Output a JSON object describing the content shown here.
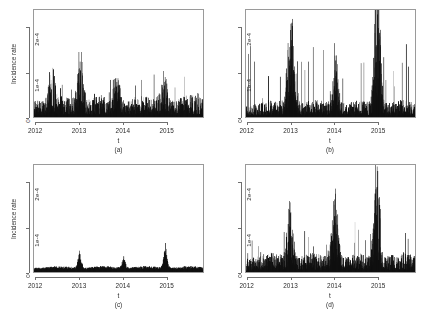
{
  "figure": {
    "width": 423,
    "height": 310,
    "background": "#ffffff",
    "ink_color": "#111111",
    "axis_color": "#6f6f6f",
    "box_color": "#9a9a9a",
    "panel_count": 4,
    "layout": "2x2 grid of time-series panels"
  },
  "chart_data": [
    {
      "id": "a",
      "type": "area",
      "caption": "(a)",
      "title": "",
      "xlabel": "t",
      "ylabel": "Incidence rate",
      "show_ylabel": true,
      "xtick_labels": [
        "2012",
        "2013",
        "2014",
        "2015"
      ],
      "xtick_values": [
        2012,
        2013,
        2014,
        2015
      ],
      "ytick_labels": [
        "0",
        "1e-4",
        "2e-4"
      ],
      "ytick_values": [
        0,
        0.0001,
        0.0002
      ],
      "xlim": [
        2011.95,
        2015.85
      ],
      "ylim": [
        0,
        0.00024
      ],
      "grid": false,
      "legend": "none",
      "series_description": "Daily incidence rate, dense noisy spikes on a raised baseline; broad seasonal humps peaking near 2013 (max ~1.05e-4), smaller humps near 2012.4, 2013.85, 2014.95.",
      "peaks": [
        {
          "x": 2012.35,
          "y": 6.2e-05
        },
        {
          "x": 2013.02,
          "y": 0.000105
        },
        {
          "x": 2013.85,
          "y": 6.8e-05
        },
        {
          "x": 2014.95,
          "y": 6.2e-05
        }
      ],
      "baseline_level": 1.8e-05,
      "noise_scale": 2e-05,
      "max_value": 0.000105,
      "seed": 17
    },
    {
      "id": "b",
      "type": "area",
      "caption": "(b)",
      "title": "",
      "xlabel": "t",
      "ylabel": "",
      "show_ylabel": false,
      "xtick_labels": [
        "2012",
        "2013",
        "2014",
        "2015"
      ],
      "xtick_values": [
        2012,
        2013,
        2014,
        2015
      ],
      "ytick_labels": [
        "0",
        "1e-4",
        "2e-4"
      ],
      "ytick_values": [
        0,
        0.0001,
        0.0002
      ],
      "xlim": [
        2011.95,
        2015.85
      ],
      "ylim": [
        0,
        0.00024
      ],
      "grid": false,
      "legend": "none",
      "series_description": "Very spiky daily series with tall thin isolated spikes; clusters near 2013 (~1.15e-4), 2014 (~1.05e-4) and a dominant single spike at 2015 reaching ~2.3e-4.",
      "peaks": [
        {
          "x": 2012.95,
          "y": 0.000115
        },
        {
          "x": 2013.05,
          "y": 0.000105
        },
        {
          "x": 2014.0,
          "y": 0.000105
        },
        {
          "x": 2014.98,
          "y": 0.00023
        }
      ],
      "baseline_level": 1.4e-05,
      "noise_scale": 4e-05,
      "max_value": 0.00023,
      "seed": 42
    },
    {
      "id": "c",
      "type": "area",
      "caption": "(c)",
      "title": "",
      "xlabel": "t",
      "ylabel": "Incidence rate",
      "show_ylabel": true,
      "xtick_labels": [
        "2012",
        "2013",
        "2014",
        "2015"
      ],
      "xtick_values": [
        2012,
        2013,
        2014,
        2015
      ],
      "ytick_labels": [
        "0",
        "1e-4",
        "2e-4"
      ],
      "ytick_values": [
        0,
        0.0001,
        0.0002
      ],
      "xlim": [
        2011.95,
        2015.85
      ],
      "ylim": [
        0,
        0.00024
      ],
      "grid": false,
      "legend": "none",
      "series_description": "Smoothed low-amplitude series close to zero with three narrow annual peaks at 2013 (~0.48e-4), 2014 (~0.35e-4) and 2015 (~0.65e-4).",
      "peaks": [
        {
          "x": 2013.0,
          "y": 4.8e-05
        },
        {
          "x": 2014.02,
          "y": 3.5e-05
        },
        {
          "x": 2014.98,
          "y": 6.5e-05
        }
      ],
      "baseline_level": 9e-06,
      "noise_scale": 8e-06,
      "max_value": 6.5e-05,
      "seed": 7
    },
    {
      "id": "d",
      "type": "area",
      "caption": "(d)",
      "title": "",
      "xlabel": "t",
      "ylabel": "",
      "show_ylabel": false,
      "xtick_labels": [
        "2012",
        "2013",
        "2014",
        "2015"
      ],
      "xtick_values": [
        2012,
        2013,
        2014,
        2015
      ],
      "ytick_labels": [
        "0",
        "1e-4",
        "2e-4"
      ],
      "ytick_values": [
        0,
        0.0001,
        0.0002
      ],
      "xlim": [
        2011.95,
        2015.85
      ],
      "ylim": [
        0,
        0.00024
      ],
      "grid": false,
      "legend": "none",
      "series_description": "Noisy daily series with moderate baseline and three pronounced annual peaks: 2013 (~1.0e-4), 2014 (~1.25e-4) and a tall peak at 2015 (~1.9e-4).",
      "peaks": [
        {
          "x": 2012.97,
          "y": 0.0001
        },
        {
          "x": 2014.0,
          "y": 0.000125
        },
        {
          "x": 2014.97,
          "y": 0.00019
        }
      ],
      "baseline_level": 1.6e-05,
      "noise_scale": 2.2e-05,
      "max_value": 0.00019,
      "seed": 99
    }
  ]
}
